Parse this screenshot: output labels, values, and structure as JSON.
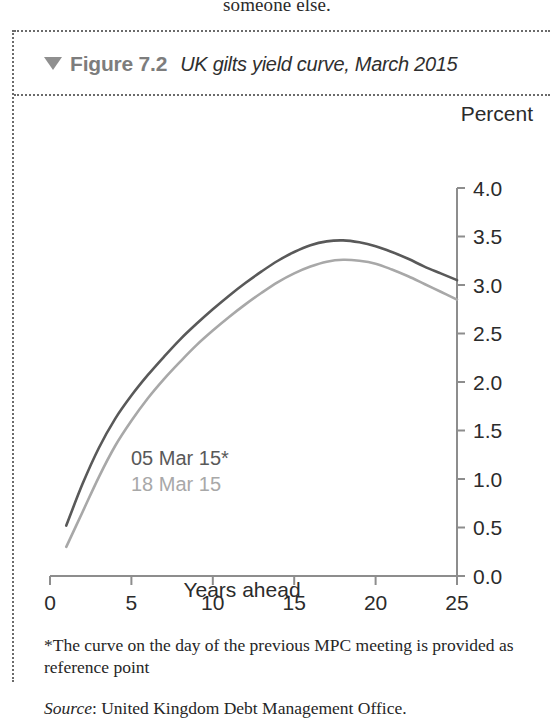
{
  "page": {
    "running_text": "someone else."
  },
  "figure": {
    "marker_icon": "triangle-down-icon",
    "number_label": "Figure 7.2",
    "title": "UK gilts yield curve, March 2015",
    "footnote": "*The curve on the day of the previous MPC meeting is provided as reference point",
    "source_label": "Source",
    "source_text": ": United Kingdom Debt Management Office."
  },
  "legend": {
    "items": [
      {
        "label": "05 Mar 15*",
        "color": "#595959"
      },
      {
        "label": "18 Mar 15",
        "color": "#a8a8a8"
      }
    ]
  },
  "chart_data": {
    "type": "line",
    "title": "UK gilts yield curve, March 2015",
    "xlabel": "Years ahead",
    "ylabel": "Percent",
    "unit_label": "Percent",
    "xlim": [
      0,
      25
    ],
    "ylim": [
      0.0,
      4.0
    ],
    "grid": false,
    "y_axis_position": "right",
    "legend_position": "inside-lower-left",
    "xticks": [
      0,
      5,
      10,
      15,
      20,
      25
    ],
    "xtick_labels": [
      "0",
      "5",
      "10",
      "15",
      "20",
      "25"
    ],
    "yticks": [
      0.0,
      0.5,
      1.0,
      1.5,
      2.0,
      2.5,
      3.0,
      3.5,
      4.0
    ],
    "ytick_labels": [
      "0.0",
      "0.5",
      "1.0",
      "1.5",
      "2.0",
      "2.5",
      "3.0",
      "3.5",
      "4.0"
    ],
    "x": [
      1,
      2,
      3,
      4,
      5,
      6,
      7,
      8,
      9,
      10,
      11,
      12,
      13,
      14,
      15,
      16,
      17,
      18,
      19,
      20,
      21,
      22,
      23,
      24,
      25
    ],
    "series": [
      {
        "name": "05 Mar 15*",
        "color": "#595959",
        "values": [
          0.52,
          0.95,
          1.32,
          1.62,
          1.86,
          2.07,
          2.26,
          2.44,
          2.6,
          2.75,
          2.89,
          3.02,
          3.14,
          3.25,
          3.34,
          3.41,
          3.45,
          3.46,
          3.44,
          3.4,
          3.34,
          3.27,
          3.19,
          3.12,
          3.05
        ]
      },
      {
        "name": "18 Mar 15",
        "color": "#a8a8a8",
        "values": [
          0.3,
          0.66,
          1.02,
          1.34,
          1.6,
          1.83,
          2.03,
          2.21,
          2.38,
          2.53,
          2.67,
          2.8,
          2.92,
          3.03,
          3.12,
          3.19,
          3.24,
          3.26,
          3.25,
          3.22,
          3.16,
          3.09,
          3.01,
          2.93,
          2.85
        ]
      }
    ]
  }
}
